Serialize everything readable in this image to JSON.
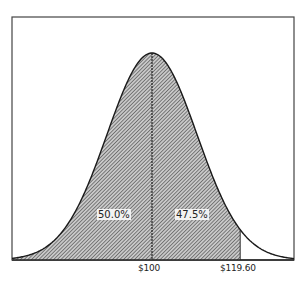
{
  "chart_data": {
    "type": "area",
    "title": "",
    "xlabel": "",
    "ylabel": "",
    "distribution": {
      "mean": 100,
      "std_dev": 10,
      "mean_label": "$100",
      "upper_label": "$119.60",
      "upper_value": 119.6
    },
    "regions": [
      {
        "name": "left-half",
        "from": "-inf",
        "to": 100,
        "label": "50.0%",
        "value": 50.0,
        "shaded": true
      },
      {
        "name": "mean-to-upper",
        "from": 100,
        "to": 119.6,
        "label": "47.5%",
        "value": 47.5,
        "shaded": true
      },
      {
        "name": "upper-tail",
        "from": 119.6,
        "to": "inf",
        "label": "",
        "value": 2.5,
        "shaded": false
      }
    ],
    "x_ticks": [
      {
        "value": 100,
        "label": "$100"
      },
      {
        "value": 119.6,
        "label": "$119.60"
      }
    ],
    "grid": false,
    "legend": null
  },
  "layout": {
    "frame": {
      "left": 12,
      "top": 17,
      "right": 294,
      "bottom": 260
    },
    "mean_x": 152,
    "sigma_px": 45,
    "peak_y": 53,
    "colors": {
      "line": "#222222",
      "hatch": "#333333",
      "fill_bg": "#bdbdbd",
      "frame": "#444444"
    }
  }
}
